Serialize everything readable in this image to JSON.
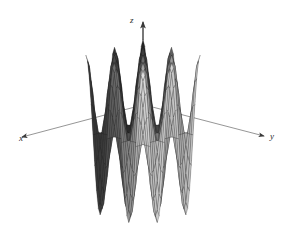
{
  "figure": {
    "caption": "",
    "background_color": "#ffffff",
    "width": 287,
    "height": 226
  },
  "axes": {
    "x": {
      "label": "x",
      "icon": "axis-arrow-icon",
      "direction": "left-down"
    },
    "y": {
      "label": "y",
      "icon": "axis-arrow-icon",
      "direction": "right-down"
    },
    "z": {
      "label": "z",
      "icon": "axis-arrow-icon",
      "direction": "up"
    },
    "line_color": "#7a7a7a",
    "arrow_color": "#3a3a3a"
  },
  "chart_data": {
    "type": "surface",
    "title": "",
    "xlabel": "x",
    "ylabel": "y",
    "zlabel": "z",
    "grid": false,
    "legend": "none",
    "wireframe": true,
    "mesh_style": "diamond",
    "mesh_color": "#1f1f1f",
    "colormap": "grayscale",
    "projection": "3d-isometric",
    "function": "z = cos(x) * cos(y)",
    "xlim": [
      -6.2832,
      6.2832
    ],
    "ylim": [
      -6.2832,
      6.2832
    ],
    "zlim": [
      -1,
      1
    ],
    "samples": {
      "nx": 32,
      "ny": 32
    },
    "peaks": [
      {
        "name": "center-back-peak",
        "x": 0,
        "y": 0,
        "z": 1,
        "shade": "#3a3a3a"
      },
      {
        "name": "left-peak",
        "x": -3.1416,
        "y": 0,
        "z": 1,
        "shade": "#5e5e5e"
      },
      {
        "name": "right-peak",
        "x": 3.1416,
        "y": 0,
        "z": 1,
        "shade": "#6e6e6e"
      },
      {
        "name": "front-peak",
        "x": 0,
        "y": 3.1416,
        "z": 1,
        "shade": "#d2d2d2"
      },
      {
        "name": "front-left-peak",
        "x": -3.1416,
        "y": 3.1416,
        "z": 1,
        "shade": "#8a8a8a"
      },
      {
        "name": "front-right-peak",
        "x": 3.1416,
        "y": 3.1416,
        "z": 1,
        "shade": "#9a9a9a"
      }
    ],
    "values": [
      1,
      1,
      1,
      1,
      1,
      1
    ],
    "categories": [
      "center-back-peak",
      "left-peak",
      "right-peak",
      "front-peak",
      "front-left-peak",
      "front-right-peak"
    ]
  }
}
